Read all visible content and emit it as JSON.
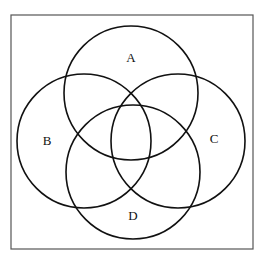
{
  "diagram": {
    "type": "venn",
    "sets": [
      {
        "label": "A",
        "cx": 131,
        "cy": 93,
        "r": 67,
        "lx": 131,
        "ly": 59
      },
      {
        "label": "B",
        "cx": 84,
        "cy": 141,
        "r": 67,
        "lx": 47,
        "ly": 142
      },
      {
        "label": "C",
        "cx": 178,
        "cy": 141,
        "r": 67,
        "lx": 214,
        "ly": 140
      },
      {
        "label": "D",
        "cx": 133,
        "cy": 172,
        "r": 67,
        "lx": 133,
        "ly": 217
      }
    ],
    "frame": {
      "x": 11,
      "y": 15,
      "w": 242,
      "h": 234
    },
    "stroke_color": "#111111",
    "frame_color": "#555555"
  }
}
